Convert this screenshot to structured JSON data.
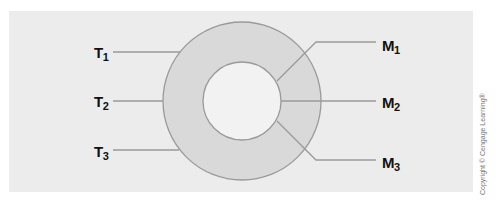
{
  "diagram": {
    "left_labels": [
      {
        "letter": "T",
        "sub": "1"
      },
      {
        "letter": "T",
        "sub": "2"
      },
      {
        "letter": "T",
        "sub": "3"
      }
    ],
    "right_labels": [
      {
        "letter": "M",
        "sub": "1"
      },
      {
        "letter": "M",
        "sub": "2"
      },
      {
        "letter": "M",
        "sub": "3"
      }
    ],
    "colors": {
      "background_panel": "#ececec",
      "ring_fill": "#d9d9d9",
      "inner_fill": "#f2f2f2",
      "stroke": "#9a9a9a"
    }
  },
  "copyright": "Copyright © Cengage Learning®"
}
